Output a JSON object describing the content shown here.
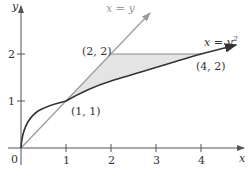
{
  "figure": {
    "axes": {
      "x_label": "x",
      "y_label": "y",
      "origin_label": "0",
      "x_ticks": [
        "1",
        "2",
        "3",
        "4"
      ],
      "y_ticks": [
        "1",
        "2"
      ]
    },
    "curves": {
      "line_label": "x = y",
      "parabola_label": "x = y",
      "parabola_exponent": "2"
    },
    "points": [
      {
        "label": "(1, 1)"
      },
      {
        "label": "(2, 2)"
      },
      {
        "label": "(4, 2)"
      }
    ],
    "colors": {
      "axis": "#555555",
      "parabola": "#333333",
      "line": "#9a9a9a",
      "shaded_region": "#e4e4e4"
    }
  }
}
